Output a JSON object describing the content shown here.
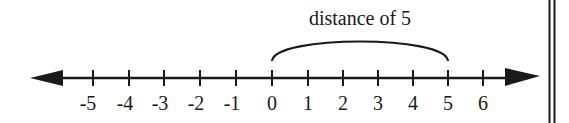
{
  "diagram": {
    "type": "number-line",
    "annotation": "distance of 5",
    "ticks": [
      "-5",
      "-4",
      "-3",
      "-2",
      "-1",
      "0",
      "1",
      "2",
      "3",
      "4",
      "5",
      "6"
    ],
    "arc_from": "0",
    "arc_to": "5",
    "line_color": "#1a1a1a"
  }
}
